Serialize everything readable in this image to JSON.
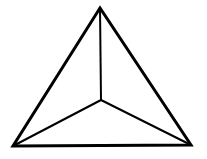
{
  "diagram": {
    "type": "tetrahedron-top-view",
    "stroke_color": "#000000",
    "background": "#ffffff",
    "vertices": {
      "top": [
        100,
        8
      ],
      "bottom_left": [
        13,
        146
      ],
      "bottom_right": [
        191,
        145
      ],
      "center": [
        101,
        100
      ]
    },
    "outer_edges": [
      [
        "top",
        "bottom_left"
      ],
      [
        "bottom_left",
        "bottom_right"
      ],
      [
        "bottom_right",
        "top"
      ]
    ],
    "inner_edges": [
      [
        "center",
        "top"
      ],
      [
        "center",
        "bottom_left"
      ],
      [
        "center",
        "bottom_right"
      ]
    ]
  }
}
